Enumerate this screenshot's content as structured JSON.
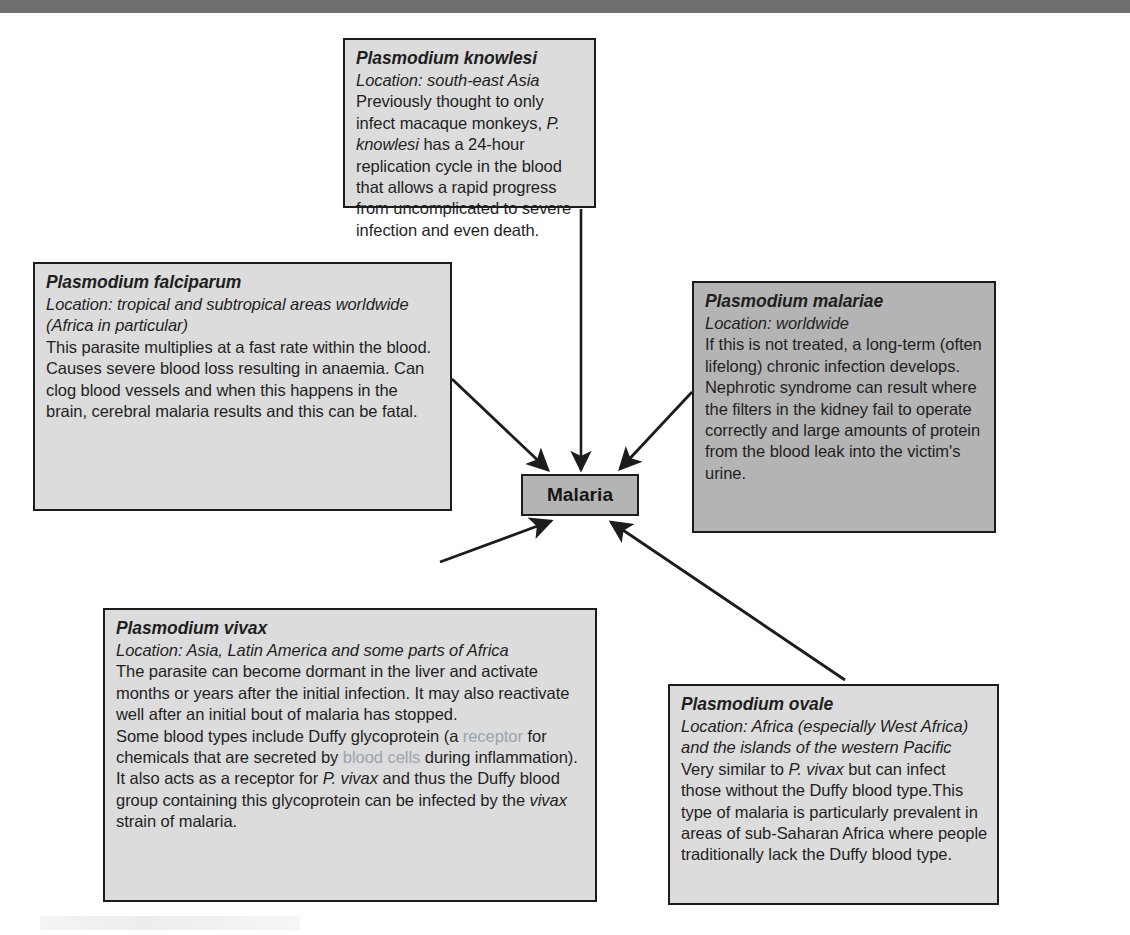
{
  "page": {
    "top_bar_color": "#6e6e6e",
    "box_fill_light": "#dcdcdc",
    "box_fill_dark": "#b4b4b4",
    "box_border_color": "#1c1c1c",
    "muted_text_color": "#9aa4ae"
  },
  "center": {
    "label": "Malaria"
  },
  "boxes": {
    "knowlesi": {
      "species": "Plasmodium knowlesi",
      "location": "Location: south-east Asia",
      "body_pre": "Previously thought to only infect macaque monkeys, ",
      "body_italic": "P. knowlesi",
      "body_post": " has a 24-hour replication cycle in the blood that allows a rapid progress from uncomplicated to severe infection and even death."
    },
    "falciparum": {
      "species": "Plasmodium falciparum",
      "location": "Location: tropical and subtropical areas worldwide (Africa in particular)",
      "body": "This parasite multiplies at a fast rate within the blood. Causes severe blood loss resulting in anaemia. Can clog blood vessels and when this happens in the brain, cerebral malaria results and this can be fatal."
    },
    "malariae": {
      "species": "Plasmodium malariae",
      "location": "Location: worldwide",
      "body": "If this is not treated, a long-term (often lifelong) chronic infection develops. Nephrotic syndrome can result where the filters in the kidney fail to operate correctly and large amounts of protein from the blood leak into the victim's urine."
    },
    "vivax": {
      "species": "Plasmodium vivax",
      "location": "Location: Asia, Latin America and some parts of Africa",
      "para1": "The parasite can become dormant in the liver and activate months or years after the initial infection. It may also reactivate well after an initial bout of malaria has stopped.",
      "para2_a": "Some blood types include Duffy glycoprotein (a ",
      "para2_muted1": "receptor",
      "para2_b": " for chemicals that are secreted by ",
      "para2_muted2": "blood cells",
      "para2_c": " during inflammation). It also acts as a receptor for ",
      "para2_italic1": "P. vivax",
      "para2_d": " and thus the Duffy blood group containing this glycoprotein can be infected by the ",
      "para2_italic2": "vivax",
      "para2_e": " strain of malaria."
    },
    "ovale": {
      "species": "Plasmodium ovale",
      "location": "Location: Africa (especially West Africa) and the islands of the western Pacific",
      "body_pre": "Very similar to ",
      "body_italic": "P. vivax",
      "body_post": " but can infect those without the Duffy blood type.This type of malaria is particularly prevalent in areas of sub-Saharan Africa where people traditionally lack the Duffy blood type."
    }
  },
  "arrows": [
    {
      "name": "arrow-knowlesi-to-malaria",
      "from": "knowlesi",
      "to": "malaria"
    },
    {
      "name": "arrow-falciparum-to-malaria",
      "from": "falciparum",
      "to": "malaria"
    },
    {
      "name": "arrow-malariae-to-malaria",
      "from": "malariae",
      "to": "malaria"
    },
    {
      "name": "arrow-vivax-to-malaria",
      "from": "vivax",
      "to": "malaria"
    },
    {
      "name": "arrow-ovale-to-malaria",
      "from": "ovale",
      "to": "malaria"
    }
  ]
}
